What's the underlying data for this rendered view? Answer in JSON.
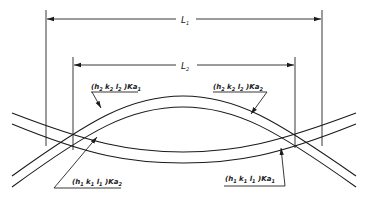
{
  "diagram": {
    "dimensions": [
      {
        "id": "L1",
        "label": "L",
        "subscript": "1"
      },
      {
        "id": "L2",
        "label": "L",
        "subscript": "2"
      }
    ],
    "labels": {
      "upper_left": {
        "prefix": "(h",
        "s1": "2",
        "mid1": " k",
        "s2": "2",
        "mid2": " l",
        "s3": "2",
        "suffix": " )Ka",
        "s4": "1"
      },
      "upper_right": {
        "prefix": "(h",
        "s1": "2",
        "mid1": " k",
        "s2": "2",
        "mid2": " l",
        "s3": "2",
        "suffix": " )Ka",
        "s4": "2"
      },
      "lower_left": {
        "prefix": "(h",
        "s1": "1",
        "mid1": "  k",
        "s2": "1",
        "mid2": " l",
        "s3": "1",
        "suffix": " )Ka",
        "s4": "2"
      },
      "lower_right": {
        "prefix": "(h",
        "s1": "1",
        "mid1": "  k",
        "s2": "1",
        "mid2": " l",
        "s3": "1",
        "suffix": " )Ka",
        "s4": "1"
      }
    },
    "colors": {
      "ink": "#1a1a1a",
      "background": "#ffffff"
    }
  }
}
